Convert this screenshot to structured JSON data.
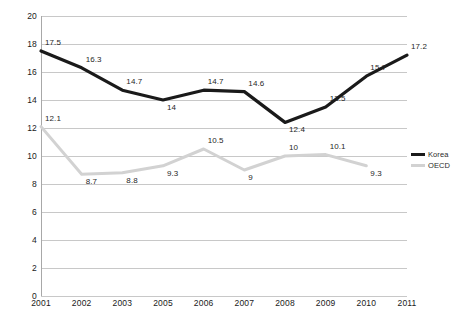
{
  "chart_data": {
    "type": "line",
    "title": "",
    "subtitle": "",
    "xlabel": "",
    "ylabel": "",
    "categories": [
      "2001",
      "2002",
      "2003",
      "2005",
      "2006",
      "2007",
      "2008",
      "2009",
      "2010",
      "2011"
    ],
    "ylim": [
      0,
      20
    ],
    "ytick_step": 2,
    "yticks": [
      "20",
      "18",
      "16",
      "14",
      "12",
      "10",
      "8",
      "6",
      "4",
      "2",
      "0"
    ],
    "grid": true,
    "legend_position": "right",
    "series": [
      {
        "name": "Korea",
        "color": "#1a1a1a",
        "values": [
          17.5,
          16.3,
          14.7,
          14,
          14.7,
          14.6,
          12.4,
          13.5,
          15.7,
          17.2
        ],
        "labels": [
          "17.5",
          "16.3",
          "14.7",
          "14",
          "14.7",
          "14.6",
          "12.4",
          "13.5",
          "15.7",
          "17.2"
        ]
      },
      {
        "name": "OECD",
        "color": "#d2d2d2",
        "values": [
          12.1,
          8.7,
          8.8,
          9.3,
          10.5,
          9,
          10,
          10.1,
          9.3,
          null
        ],
        "labels": [
          "12.1",
          "8.7",
          "8.8",
          "9.3",
          "10.5",
          "9",
          "10",
          "10.1",
          "9.3",
          ""
        ]
      }
    ]
  },
  "legend": {
    "items": [
      {
        "label": "Korea"
      },
      {
        "label": "OECD"
      }
    ]
  }
}
